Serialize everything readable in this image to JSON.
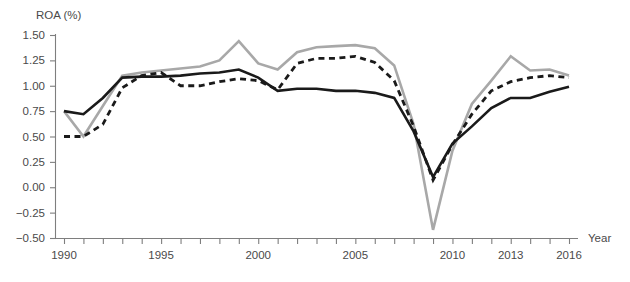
{
  "chart_data": {
    "type": "line",
    "title": "",
    "subtitle": "",
    "xlabel": "Year",
    "ylabel": "ROA (%)",
    "xlim": [
      1990,
      2016
    ],
    "ylim": [
      -0.5,
      1.5
    ],
    "grid": false,
    "legend_position": "none",
    "y_ticks": [
      1.5,
      1.25,
      1.0,
      0.75,
      0.5,
      0.25,
      0.0,
      -0.25,
      -0.5
    ],
    "y_tick_labels": [
      "1.50",
      "1.25",
      "1.00",
      "0.75",
      "0.50",
      "0.25",
      "0.00",
      "−0.25",
      "−0.50"
    ],
    "x_ticks": [
      1990,
      1991,
      1992,
      1993,
      1994,
      1995,
      1996,
      1997,
      1998,
      1999,
      2000,
      2001,
      2002,
      2003,
      2004,
      2005,
      2006,
      2007,
      2008,
      2009,
      2010,
      2011,
      2012,
      2013,
      2014,
      2015,
      2016
    ],
    "x_tick_labels_shown": [
      "1990",
      "1995",
      "2000",
      "2005",
      "2010",
      "2013",
      "2016"
    ],
    "x_labeled_years": [
      1990,
      1995,
      2000,
      2005,
      2010,
      2013,
      2016
    ],
    "x": [
      1990,
      1991,
      1992,
      1993,
      1994,
      1995,
      1996,
      1997,
      1998,
      1999,
      2000,
      2001,
      2002,
      2003,
      2004,
      2005,
      2006,
      2007,
      2008,
      2009,
      2010,
      2011,
      2012,
      2013,
      2014,
      2015,
      2016
    ],
    "series": [
      {
        "name": "series-gray-solid",
        "style": "solid",
        "color": "#a8a8a8",
        "width": 2.6,
        "values": [
          0.75,
          0.5,
          0.8,
          1.1,
          1.13,
          1.15,
          1.17,
          1.19,
          1.25,
          1.44,
          1.22,
          1.16,
          1.33,
          1.38,
          1.39,
          1.4,
          1.37,
          1.2,
          0.62,
          -0.42,
          0.36,
          0.82,
          1.05,
          1.29,
          1.15,
          1.16,
          1.1
        ]
      },
      {
        "name": "series-black-solid",
        "style": "solid",
        "color": "#1a1a1a",
        "width": 2.6,
        "values": [
          0.75,
          0.72,
          0.88,
          1.08,
          1.09,
          1.09,
          1.1,
          1.12,
          1.13,
          1.16,
          1.08,
          0.95,
          0.97,
          0.97,
          0.95,
          0.95,
          0.93,
          0.88,
          0.55,
          0.1,
          0.43,
          0.6,
          0.78,
          0.88,
          0.88,
          0.94,
          0.99
        ]
      },
      {
        "name": "series-black-dashed",
        "style": "dashed",
        "color": "#1a1a1a",
        "width": 2.8,
        "dash": "6,4.5",
        "values": [
          0.5,
          0.5,
          0.62,
          0.98,
          1.1,
          1.13,
          1.0,
          1.0,
          1.04,
          1.07,
          1.05,
          0.96,
          1.22,
          1.27,
          1.27,
          1.29,
          1.23,
          1.05,
          0.6,
          0.07,
          0.42,
          0.72,
          0.95,
          1.04,
          1.08,
          1.1,
          1.08
        ]
      }
    ]
  },
  "axes": {
    "y_axis_label": "ROA (%)",
    "x_axis_label": "Year"
  }
}
